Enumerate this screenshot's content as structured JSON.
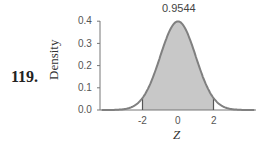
{
  "problem_number": "119.",
  "chart_data": {
    "type": "area",
    "title": "",
    "xlabel": "Z",
    "ylabel": "Density",
    "yticks": [
      "0.0",
      "0.1",
      "0.2",
      "0.3",
      "0.4"
    ],
    "xticks": [
      "-2",
      "0",
      "2"
    ],
    "ylim": [
      0,
      0.4
    ],
    "xlim": [
      -4,
      4
    ],
    "curve": "standard normal density",
    "shaded_region": {
      "from": -2,
      "to": 2,
      "area": 0.9544
    },
    "annotation": "0.9544",
    "colors": {
      "curve": "#808080",
      "fill": "#c8c8c8",
      "axis": "#777777"
    }
  }
}
